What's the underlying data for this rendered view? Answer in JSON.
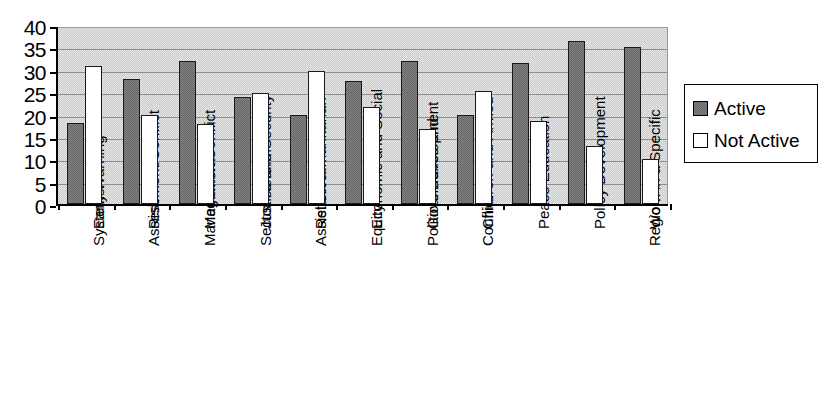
{
  "chart_data": {
    "type": "bar",
    "title": "",
    "xlabel": "",
    "ylabel": "",
    "ylim": [
      0,
      40
    ],
    "y_ticks": [
      0,
      5,
      10,
      15,
      20,
      25,
      30,
      35,
      40
    ],
    "grid": true,
    "legend_position": "right",
    "categories": [
      "Early Warning Systems",
      "Risk Assessment/Conflict",
      "Mediation/Conflict Management",
      "Justice and Security Sector Reform",
      "Relief/Humanitarian Assistance",
      "Economic and Social Equity",
      "Governance and Political Development",
      "Children and Armed Conflict",
      "Peace Education",
      "Policy Development",
      "Work in a Specific Region"
    ],
    "category_lines": [
      [
        "Early Warning",
        "Systems"
      ],
      [
        "Risk",
        "Assessment/Conflict"
      ],
      [
        "Mediation/Conflict",
        "Management"
      ],
      [
        "Justice and Security",
        "Sector Reform"
      ],
      [
        "Relief/Humanitarian",
        "Assistance"
      ],
      [
        "Economic and Social",
        "Equity"
      ],
      [
        "Governance and",
        "Political Development"
      ],
      [
        "Children and Armed",
        "Conflict"
      ],
      [
        "Peace Education"
      ],
      [
        "Policy Development"
      ],
      [
        "Work in a Specific",
        "Region"
      ]
    ],
    "series": [
      {
        "name": "Active",
        "color": "#666666",
        "values": [
          18,
          28,
          32,
          24,
          20,
          27.5,
          32,
          20,
          31.5,
          36.5,
          35
        ]
      },
      {
        "name": "Not Active",
        "color": "#ffffff",
        "values": [
          30.8,
          19.8,
          17.8,
          24.8,
          29.7,
          21.7,
          16.8,
          25.3,
          18.5,
          13,
          10
        ]
      }
    ]
  },
  "legend": {
    "entries": [
      {
        "label": "Active",
        "swatch": "active"
      },
      {
        "label": "Not Active",
        "swatch": "notactive"
      }
    ]
  }
}
